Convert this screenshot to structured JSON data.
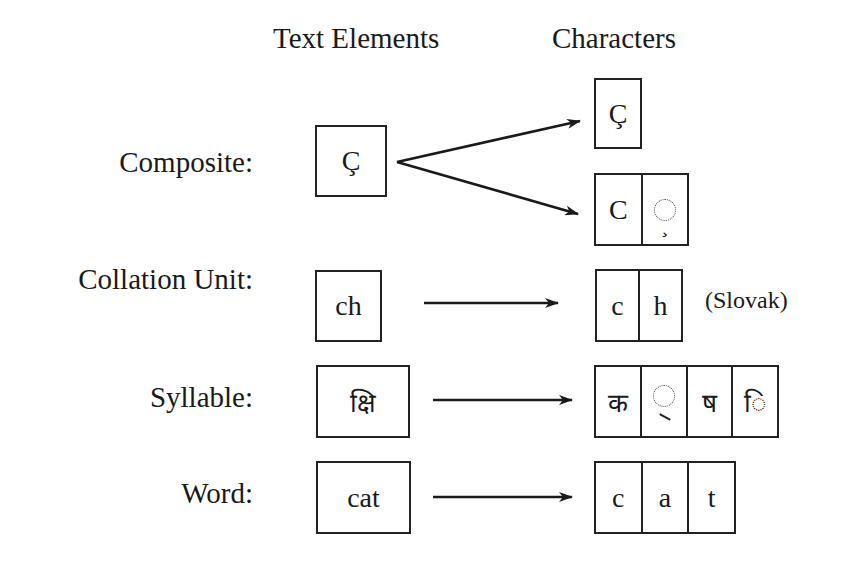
{
  "headers": {
    "text_elements": "Text Elements",
    "characters": "Characters"
  },
  "rows": [
    {
      "label": "Composite:",
      "text_element": "Ç",
      "character_sets": [
        [
          "Ç"
        ],
        [
          "C",
          "◌̧"
        ]
      ],
      "dotted_circle_placeholder": "dotted-circle with cedilla (combining cedilla U+0327)"
    },
    {
      "label": "Collation Unit:",
      "text_element": "ch",
      "characters": [
        "c",
        "h"
      ],
      "note": "(Slovak)"
    },
    {
      "label": "Syllable:",
      "text_element": "क्षि",
      "characters": [
        "क",
        "◌्",
        "ष",
        "ि"
      ]
    },
    {
      "label": "Word:",
      "text_element": "cat",
      "characters": [
        "c",
        "a",
        "t"
      ]
    }
  ],
  "colors": {
    "stroke": "#222222",
    "text": "#1a1a1a",
    "background": "#ffffff"
  }
}
